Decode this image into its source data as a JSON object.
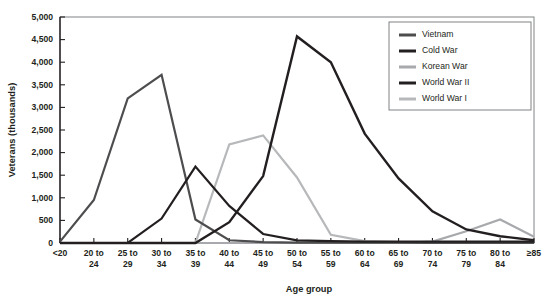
{
  "chart_data": {
    "type": "line",
    "title": "",
    "xlabel": "Age group",
    "ylabel": "Veterans (thousands)",
    "ylim": [
      0,
      5000
    ],
    "ytick_step": 500,
    "grid": false,
    "legend_position": "top-right",
    "categories": [
      "<20",
      "20 to\n24",
      "25 to\n29",
      "30 to\n34",
      "35 to\n39",
      "40 to\n44",
      "45 to\n49",
      "50 to\n54",
      "55 to\n59",
      "60 to\n64",
      "65 to\n69",
      "70 to\n74",
      "75 to\n79",
      "80 to\n84",
      "≥85"
    ],
    "ytick_labels": [
      "0",
      "500",
      "1,000",
      "1,500",
      "2,000",
      "2,500",
      "3,000",
      "3,500",
      "4,000",
      "4,500",
      "5,000"
    ],
    "ytick_values": [
      0,
      500,
      1000,
      1500,
      2000,
      2500,
      3000,
      3500,
      4000,
      4500,
      5000
    ],
    "series": [
      {
        "name": "Vietnam",
        "color": "#4d4d4f",
        "width": 2.2,
        "values": [
          30,
          950,
          3200,
          3720,
          520,
          60,
          20,
          10,
          10,
          10,
          10,
          10,
          10,
          10,
          10
        ]
      },
      {
        "name": "Cold War",
        "color": "#231f20",
        "width": 2.4,
        "values": [
          0,
          0,
          0,
          0,
          0,
          460,
          1480,
          4570,
          4000,
          2420,
          1430,
          700,
          300,
          150,
          60
        ]
      },
      {
        "name": "Korean War",
        "color": "#a7a9ac",
        "width": 2.2,
        "values": [
          0,
          0,
          0,
          0,
          0,
          0,
          0,
          0,
          0,
          0,
          0,
          30,
          260,
          520,
          140
        ]
      },
      {
        "name": "World War II",
        "color": "#231f20",
        "width": 2.2,
        "values": [
          0,
          0,
          0,
          540,
          1690,
          820,
          200,
          60,
          40,
          30,
          30,
          30,
          30,
          30,
          30
        ]
      },
      {
        "name": "World War I",
        "color": "#b6b8ba",
        "width": 2.2,
        "values": [
          0,
          0,
          0,
          0,
          0,
          2180,
          2380,
          1450,
          180,
          40,
          20,
          20,
          20,
          20,
          20
        ]
      }
    ]
  },
  "legend": {
    "entries": [
      {
        "label": "Vietnam"
      },
      {
        "label": "Cold War"
      },
      {
        "label": "Korean War"
      },
      {
        "label": "World War II"
      },
      {
        "label": "World War I"
      }
    ]
  }
}
